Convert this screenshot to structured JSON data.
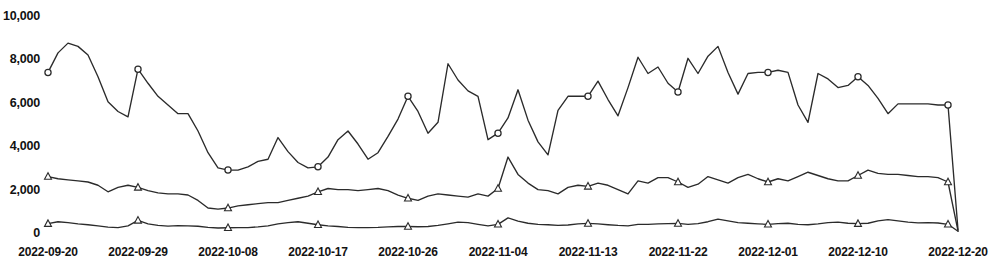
{
  "chart_data": {
    "type": "line",
    "title": "",
    "xlabel": "",
    "ylabel": "",
    "grid": false,
    "legend_position": "none",
    "ylim": [
      0,
      10000
    ],
    "y_ticks": [
      0,
      2000,
      4000,
      6000,
      8000,
      10000
    ],
    "y_tick_labels": [
      "0",
      "2,000",
      "4,000",
      "6,000",
      "8,000",
      "10,000"
    ],
    "x_tick_labels": [
      "2022-09-20",
      "2022-09-29",
      "2022-10-08",
      "2022-10-17",
      "2022-10-26",
      "2022-11-04",
      "2022-11-13",
      "2022-11-22",
      "2022-12-01",
      "2022-12-10",
      "2022-12-20"
    ],
    "x_tick_indices": [
      0,
      9,
      18,
      27,
      36,
      45,
      54,
      63,
      72,
      81,
      91
    ],
    "x": [
      "2022-09-20",
      "2022-09-21",
      "2022-09-22",
      "2022-09-23",
      "2022-09-24",
      "2022-09-25",
      "2022-09-26",
      "2022-09-27",
      "2022-09-28",
      "2022-09-29",
      "2022-09-30",
      "2022-10-01",
      "2022-10-02",
      "2022-10-03",
      "2022-10-04",
      "2022-10-05",
      "2022-10-06",
      "2022-10-07",
      "2022-10-08",
      "2022-10-09",
      "2022-10-10",
      "2022-10-11",
      "2022-10-12",
      "2022-10-13",
      "2022-10-14",
      "2022-10-15",
      "2022-10-16",
      "2022-10-17",
      "2022-10-18",
      "2022-10-19",
      "2022-10-20",
      "2022-10-21",
      "2022-10-22",
      "2022-10-23",
      "2022-10-24",
      "2022-10-25",
      "2022-10-26",
      "2022-10-27",
      "2022-10-28",
      "2022-10-29",
      "2022-10-30",
      "2022-10-31",
      "2022-11-01",
      "2022-11-02",
      "2022-11-03",
      "2022-11-04",
      "2022-11-05",
      "2022-11-06",
      "2022-11-07",
      "2022-11-08",
      "2022-11-09",
      "2022-11-10",
      "2022-11-11",
      "2022-11-12",
      "2022-11-13",
      "2022-11-14",
      "2022-11-15",
      "2022-11-16",
      "2022-11-17",
      "2022-11-18",
      "2022-11-19",
      "2022-11-20",
      "2022-11-21",
      "2022-11-22",
      "2022-11-23",
      "2022-11-24",
      "2022-11-25",
      "2022-11-26",
      "2022-11-27",
      "2022-11-28",
      "2022-11-29",
      "2022-11-30",
      "2022-12-01",
      "2022-12-02",
      "2022-12-03",
      "2022-12-04",
      "2022-12-05",
      "2022-12-06",
      "2022-12-07",
      "2022-12-08",
      "2022-12-09",
      "2022-12-10",
      "2022-12-11",
      "2022-12-12",
      "2022-12-13",
      "2022-12-14",
      "2022-12-15",
      "2022-12-16",
      "2022-12-17",
      "2022-12-18",
      "2022-12-19",
      "2022-12-20"
    ],
    "series": [
      {
        "name": "Series 1",
        "marker": "circle",
        "marker_indices": [
          0,
          9,
          18,
          27,
          36,
          45,
          54,
          63,
          72,
          81,
          90
        ],
        "values": [
          7400,
          8300,
          8750,
          8600,
          8200,
          7200,
          6050,
          5600,
          5350,
          7550,
          6900,
          6300,
          5900,
          5500,
          5500,
          4700,
          3700,
          3000,
          2900,
          2900,
          3050,
          3300,
          3400,
          4400,
          3750,
          3250,
          3000,
          3050,
          3500,
          4300,
          4700,
          4100,
          3400,
          3700,
          4450,
          5250,
          6300,
          5600,
          4600,
          5100,
          7800,
          7050,
          6550,
          6300,
          4300,
          4600,
          5300,
          6600,
          5200,
          4200,
          3600,
          5650,
          6300,
          6300,
          6300,
          7000,
          6150,
          5400,
          6700,
          8100,
          7350,
          7650,
          6900,
          6500,
          8050,
          7350,
          8150,
          8600,
          7400,
          6400,
          7350,
          7400,
          7400,
          7500,
          7400,
          5900,
          5100,
          7350,
          7100,
          6700,
          6800,
          7200,
          6800,
          6200,
          5500,
          5950,
          5950,
          5950,
          5950,
          5900,
          5900,
          150
        ]
      },
      {
        "name": "Series 2",
        "marker": "triangle",
        "marker_indices": [
          0,
          9,
          18,
          27,
          36,
          45,
          54,
          63,
          72,
          81,
          90
        ],
        "values": [
          2600,
          2500,
          2450,
          2400,
          2350,
          2200,
          1900,
          2100,
          2200,
          2100,
          1950,
          1850,
          1800,
          1800,
          1750,
          1500,
          1150,
          1100,
          1150,
          1250,
          1300,
          1350,
          1400,
          1400,
          1500,
          1600,
          1700,
          1900,
          2050,
          2000,
          2000,
          1950,
          2000,
          2050,
          1950,
          1750,
          1600,
          1500,
          1700,
          1800,
          1750,
          1700,
          1650,
          1800,
          1700,
          2050,
          3500,
          2700,
          2300,
          2000,
          1950,
          1800,
          2100,
          2200,
          2150,
          2300,
          2200,
          2000,
          1800,
          2400,
          2300,
          2550,
          2550,
          2350,
          2100,
          2250,
          2600,
          2450,
          2300,
          2550,
          2700,
          2500,
          2350,
          2500,
          2400,
          2600,
          2800,
          2650,
          2500,
          2400,
          2400,
          2650,
          2900,
          2750,
          2700,
          2700,
          2650,
          2600,
          2600,
          2550,
          2350,
          100
        ]
      },
      {
        "name": "Series 3",
        "marker": "triangle",
        "marker_indices": [
          0,
          9,
          18,
          27,
          36,
          45,
          54,
          63,
          72,
          81,
          90
        ],
        "values": [
          430,
          520,
          480,
          420,
          380,
          330,
          270,
          250,
          330,
          580,
          420,
          350,
          320,
          340,
          330,
          310,
          260,
          230,
          240,
          250,
          250,
          280,
          330,
          420,
          480,
          520,
          450,
          380,
          330,
          300,
          260,
          250,
          250,
          260,
          280,
          300,
          300,
          290,
          300,
          350,
          420,
          500,
          480,
          400,
          330,
          400,
          700,
          550,
          450,
          400,
          380,
          350,
          370,
          420,
          440,
          420,
          380,
          350,
          330,
          400,
          400,
          420,
          430,
          440,
          400,
          430,
          520,
          640,
          560,
          480,
          450,
          420,
          400,
          430,
          450,
          400,
          380,
          420,
          480,
          500,
          450,
          430,
          450,
          560,
          620,
          560,
          500,
          470,
          480,
          460,
          400,
          80
        ]
      }
    ]
  }
}
